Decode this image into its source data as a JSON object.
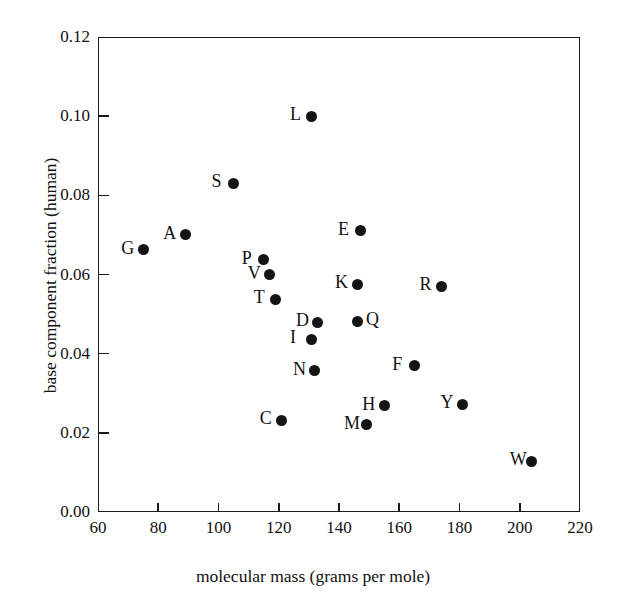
{
  "chart_data": {
    "type": "scatter",
    "title": "",
    "xlabel": "molecular mass (grams per mole)",
    "ylabel": "base component fraction (human)",
    "xlim": [
      60,
      220
    ],
    "ylim": [
      0.0,
      0.12
    ],
    "xticks": [
      60,
      80,
      100,
      120,
      140,
      160,
      180,
      200,
      220
    ],
    "xtick_labels": [
      "60",
      "80",
      "100",
      "120",
      "140",
      "160",
      "180",
      "200",
      "220"
    ],
    "yticks": [
      0.0,
      0.02,
      0.04,
      0.06,
      0.08,
      0.1,
      0.12
    ],
    "ytick_labels": [
      "0.00",
      "0.02",
      "0.04",
      "0.06",
      "0.08",
      "0.10",
      "0.12"
    ],
    "grid": false,
    "legend": "none",
    "marker": "filled-circle",
    "marker_color": "#141414",
    "points": [
      {
        "label": "G",
        "x": 75,
        "y": 0.0662,
        "label_side": "left"
      },
      {
        "label": "A",
        "x": 89,
        "y": 0.07,
        "label_side": "left"
      },
      {
        "label": "S",
        "x": 105,
        "y": 0.083,
        "label_side": "left"
      },
      {
        "label": "P",
        "x": 115,
        "y": 0.0637,
        "label_side": "left"
      },
      {
        "label": "V",
        "x": 117,
        "y": 0.06,
        "label_side": "left"
      },
      {
        "label": "T",
        "x": 119,
        "y": 0.0537,
        "label_side": "left"
      },
      {
        "label": "C",
        "x": 121,
        "y": 0.0232,
        "label_side": "left"
      },
      {
        "label": "L",
        "x": 131,
        "y": 0.1,
        "label_side": "left"
      },
      {
        "label": "I",
        "x": 131,
        "y": 0.0437,
        "label_side": "left"
      },
      {
        "label": "N",
        "x": 132,
        "y": 0.0357,
        "label_side": "left"
      },
      {
        "label": "D",
        "x": 133,
        "y": 0.0479,
        "label_side": "left"
      },
      {
        "label": "Q",
        "x": 146,
        "y": 0.0482,
        "label_side": "right"
      },
      {
        "label": "K",
        "x": 146,
        "y": 0.0575,
        "label_side": "left"
      },
      {
        "label": "E",
        "x": 147,
        "y": 0.071,
        "label_side": "left"
      },
      {
        "label": "M",
        "x": 149,
        "y": 0.0221,
        "label_side": "left"
      },
      {
        "label": "H",
        "x": 155,
        "y": 0.0268,
        "label_side": "left"
      },
      {
        "label": "F",
        "x": 165,
        "y": 0.037,
        "label_side": "left"
      },
      {
        "label": "R",
        "x": 174,
        "y": 0.057,
        "label_side": "left"
      },
      {
        "label": "Y",
        "x": 181,
        "y": 0.0272,
        "label_side": "left"
      },
      {
        "label": "W",
        "x": 204,
        "y": 0.0128,
        "label_side": "left"
      }
    ]
  }
}
